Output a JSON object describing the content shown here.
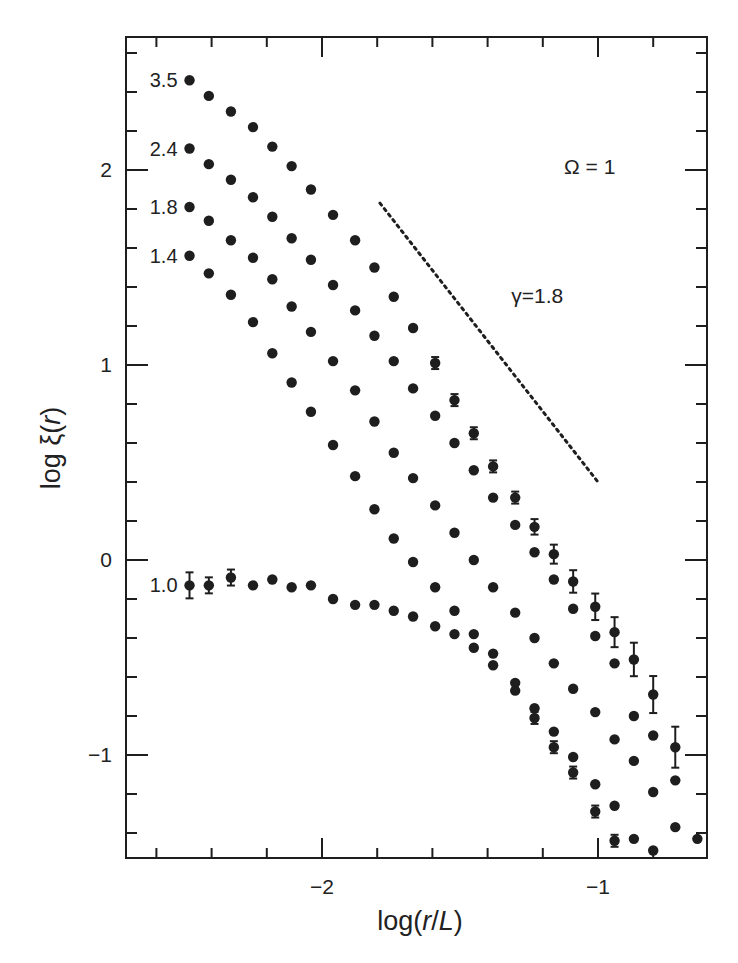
{
  "chart_data": {
    "type": "scatter",
    "title": "",
    "xlabel": "log(r/L)",
    "ylabel": "log ξ(r)",
    "xlim": [
      -2.71,
      -0.605
    ],
    "ylim": [
      -1.53,
      2.68
    ],
    "x_major_ticks": [
      -2,
      -1
    ],
    "x_tick_labels": [
      "−2",
      "−1"
    ],
    "x_minor_step": 0.2,
    "y_major_ticks": [
      -1,
      0,
      1,
      2
    ],
    "y_tick_labels": [
      "−1",
      "0",
      "1",
      "2"
    ],
    "y_minor_step": 0.2,
    "grid": false,
    "legend": "none (series labelled inline at left)",
    "annotations": [
      {
        "text": "Ω = 1",
        "x": -1.03,
        "y": 1.98
      },
      {
        "text": "γ=1.8",
        "x": -1.22,
        "y": 1.32
      }
    ],
    "reference_line": {
      "label": "γ=1.8",
      "style": "dotted",
      "slope": -1.8,
      "x": [
        -1.79,
        -1.0
      ],
      "y": [
        1.83,
        0.4
      ]
    },
    "series": [
      {
        "name": "3.5",
        "x": [
          -2.48,
          -2.41,
          -2.33,
          -2.25,
          -2.18,
          -2.11,
          -2.04,
          -1.96,
          -1.88,
          -1.81,
          -1.74,
          -1.67,
          -1.59,
          -1.52,
          -1.45,
          -1.38,
          -1.3,
          -1.23,
          -1.16,
          -1.09,
          -1.01,
          -0.94,
          -0.87,
          -0.8,
          -0.72
        ],
        "y": [
          2.46,
          2.38,
          2.3,
          2.22,
          2.12,
          2.02,
          1.9,
          1.77,
          1.64,
          1.5,
          1.35,
          1.19,
          1.01,
          0.82,
          0.65,
          0.48,
          0.32,
          0.17,
          0.03,
          -0.11,
          -0.24,
          -0.37,
          -0.51,
          -0.69,
          -0.96
        ],
        "error_bars_from_x": -1.59
      },
      {
        "name": "2.4",
        "x": [
          -2.48,
          -2.41,
          -2.33,
          -2.25,
          -2.18,
          -2.11,
          -2.04,
          -1.96,
          -1.88,
          -1.81,
          -1.74,
          -1.67,
          -1.59,
          -1.52,
          -1.45,
          -1.38,
          -1.3,
          -1.23,
          -1.16,
          -1.09,
          -1.01,
          -0.94,
          -0.87,
          -0.8,
          -0.72
        ],
        "y": [
          2.11,
          2.03,
          1.95,
          1.86,
          1.76,
          1.65,
          1.54,
          1.41,
          1.28,
          1.15,
          1.02,
          0.88,
          0.74,
          0.6,
          0.46,
          0.32,
          0.18,
          0.04,
          -0.1,
          -0.25,
          -0.39,
          -0.53,
          -0.8,
          -0.9,
          -1.13
        ]
      },
      {
        "name": "1.8",
        "x": [
          -2.48,
          -2.41,
          -2.33,
          -2.25,
          -2.18,
          -2.11,
          -2.04,
          -1.96,
          -1.88,
          -1.81,
          -1.74,
          -1.67,
          -1.59,
          -1.52,
          -1.45,
          -1.38,
          -1.3,
          -1.23,
          -1.16,
          -1.09,
          -1.01,
          -0.94,
          -0.87,
          -0.8,
          -0.72,
          -0.64
        ],
        "y": [
          1.81,
          1.74,
          1.64,
          1.55,
          1.44,
          1.3,
          1.17,
          1.02,
          0.87,
          0.71,
          0.55,
          0.42,
          0.28,
          0.14,
          0.0,
          -0.14,
          -0.27,
          -0.4,
          -0.53,
          -0.66,
          -0.78,
          -0.92,
          -1.03,
          -1.19,
          -1.37,
          -1.43
        ]
      },
      {
        "name": "1.4",
        "x": [
          -2.48,
          -2.41,
          -2.33,
          -2.25,
          -2.18,
          -2.11,
          -2.04,
          -1.96,
          -1.88,
          -1.81,
          -1.74,
          -1.67,
          -1.59,
          -1.52,
          -1.45,
          -1.38,
          -1.3,
          -1.23,
          -1.16,
          -1.09,
          -1.01,
          -0.94,
          -0.87,
          -0.8
        ],
        "y": [
          1.56,
          1.47,
          1.36,
          1.22,
          1.06,
          0.91,
          0.76,
          0.59,
          0.43,
          0.26,
          0.11,
          -0.01,
          -0.14,
          -0.26,
          -0.38,
          -0.48,
          -0.63,
          -0.76,
          -0.88,
          -1.01,
          -1.15,
          -1.26,
          -1.43,
          -1.49
        ]
      },
      {
        "name": "1.0",
        "x": [
          -2.48,
          -2.41,
          -2.33,
          -2.25,
          -2.18,
          -2.11,
          -2.04,
          -1.96,
          -1.88,
          -1.81,
          -1.74,
          -1.67,
          -1.59,
          -1.52,
          -1.45,
          -1.38,
          -1.3,
          -1.23,
          -1.16,
          -1.09,
          -1.01,
          -0.94
        ],
        "y": [
          -0.13,
          -0.13,
          -0.09,
          -0.13,
          -0.1,
          -0.14,
          -0.13,
          -0.2,
          -0.23,
          -0.23,
          -0.26,
          -0.29,
          -0.34,
          -0.38,
          -0.45,
          -0.54,
          -0.67,
          -0.81,
          -0.96,
          -1.09,
          -1.29,
          -1.44
        ],
        "error_bars_from_x": -2.48
      }
    ]
  }
}
